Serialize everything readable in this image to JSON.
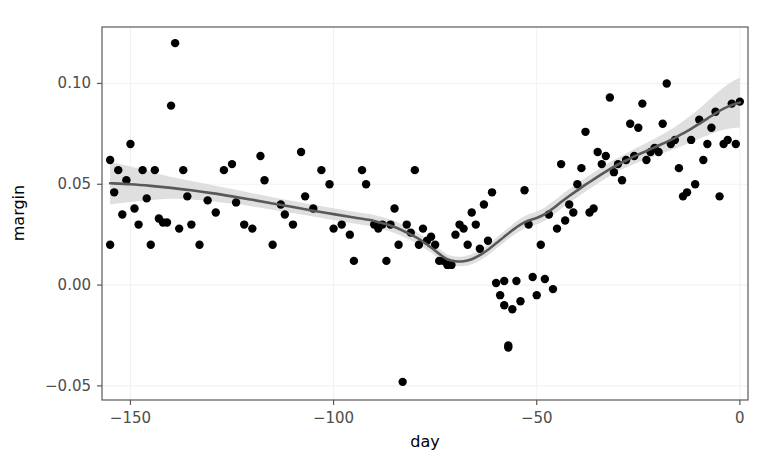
{
  "chart_data": {
    "type": "scatter",
    "title": "",
    "xlabel": "day",
    "ylabel": "margin",
    "xlim": [
      -157,
      2
    ],
    "ylim": [
      -0.057,
      0.128
    ],
    "xticks": [
      -150,
      -100,
      -50,
      0
    ],
    "xticklabels": [
      "−150",
      "−100",
      "−50",
      "0"
    ],
    "yticks": [
      -0.05,
      0.0,
      0.05,
      0.1
    ],
    "yticklabels": [
      "−0.05",
      "0.00",
      "0.05",
      "0.10"
    ],
    "grid": true,
    "legend": "none",
    "point_color": "#000000",
    "line_color": "#595959",
    "ribbon_color": "#d9d9d9",
    "panel_background": "#ffffff",
    "grid_color": "#f2f2f2",
    "panel_border_color": "#595959",
    "points": [
      [
        -155,
        0.062
      ],
      [
        -155,
        0.02
      ],
      [
        -154,
        0.046
      ],
      [
        -153,
        0.057
      ],
      [
        -152,
        0.035
      ],
      [
        -151,
        0.052
      ],
      [
        -150,
        0.07
      ],
      [
        -149,
        0.038
      ],
      [
        -148,
        0.03
      ],
      [
        -147,
        0.057
      ],
      [
        -146,
        0.043
      ],
      [
        -145,
        0.02
      ],
      [
        -144,
        0.057
      ],
      [
        -143,
        0.033
      ],
      [
        -142,
        0.031
      ],
      [
        -141,
        0.031
      ],
      [
        -140,
        0.089
      ],
      [
        -139,
        0.12
      ],
      [
        -138,
        0.028
      ],
      [
        -137,
        0.057
      ],
      [
        -136,
        0.044
      ],
      [
        -135,
        0.03
      ],
      [
        -133,
        0.02
      ],
      [
        -131,
        0.042
      ],
      [
        -129,
        0.036
      ],
      [
        -127,
        0.057
      ],
      [
        -125,
        0.06
      ],
      [
        -124,
        0.041
      ],
      [
        -122,
        0.03
      ],
      [
        -120,
        0.028
      ],
      [
        -118,
        0.064
      ],
      [
        -117,
        0.052
      ],
      [
        -115,
        0.02
      ],
      [
        -113,
        0.04
      ],
      [
        -112,
        0.035
      ],
      [
        -110,
        0.03
      ],
      [
        -108,
        0.066
      ],
      [
        -107,
        0.044
      ],
      [
        -105,
        0.038
      ],
      [
        -103,
        0.057
      ],
      [
        -101,
        0.05
      ],
      [
        -100,
        0.028
      ],
      [
        -98,
        0.03
      ],
      [
        -96,
        0.025
      ],
      [
        -95,
        0.012
      ],
      [
        -93,
        0.057
      ],
      [
        -92,
        0.05
      ],
      [
        -90,
        0.03
      ],
      [
        -89,
        0.028
      ],
      [
        -88,
        0.03
      ],
      [
        -87,
        0.012
      ],
      [
        -86,
        0.03
      ],
      [
        -85,
        0.038
      ],
      [
        -84,
        0.02
      ],
      [
        -83,
        -0.048
      ],
      [
        -82,
        0.03
      ],
      [
        -81,
        0.026
      ],
      [
        -80,
        0.057
      ],
      [
        -79,
        0.02
      ],
      [
        -78,
        0.028
      ],
      [
        -77,
        0.022
      ],
      [
        -76,
        0.024
      ],
      [
        -75,
        0.02
      ],
      [
        -74,
        0.012
      ],
      [
        -73,
        0.012
      ],
      [
        -72,
        0.01
      ],
      [
        -71,
        0.01
      ],
      [
        -70,
        0.025
      ],
      [
        -69,
        0.03
      ],
      [
        -68,
        0.028
      ],
      [
        -67,
        0.02
      ],
      [
        -66,
        0.036
      ],
      [
        -65,
        0.03
      ],
      [
        -64,
        0.018
      ],
      [
        -63,
        0.04
      ],
      [
        -62,
        0.022
      ],
      [
        -61,
        0.046
      ],
      [
        -60,
        0.001
      ],
      [
        -59,
        -0.005
      ],
      [
        -58,
        0.002
      ],
      [
        -58,
        -0.01
      ],
      [
        -57,
        -0.03
      ],
      [
        -57,
        -0.031
      ],
      [
        -56,
        -0.012
      ],
      [
        -55,
        0.002
      ],
      [
        -54,
        -0.008
      ],
      [
        -53,
        0.047
      ],
      [
        -52,
        0.03
      ],
      [
        -51,
        0.004
      ],
      [
        -50,
        -0.005
      ],
      [
        -49,
        0.02
      ],
      [
        -48,
        0.003
      ],
      [
        -47,
        0.035
      ],
      [
        -46,
        -0.002
      ],
      [
        -45,
        0.028
      ],
      [
        -44,
        0.06
      ],
      [
        -43,
        0.032
      ],
      [
        -42,
        0.04
      ],
      [
        -41,
        0.036
      ],
      [
        -40,
        0.05
      ],
      [
        -39,
        0.058
      ],
      [
        -38,
        0.076
      ],
      [
        -37,
        0.036
      ],
      [
        -36,
        0.038
      ],
      [
        -35,
        0.066
      ],
      [
        -34,
        0.06
      ],
      [
        -33,
        0.064
      ],
      [
        -32,
        0.093
      ],
      [
        -31,
        0.056
      ],
      [
        -30,
        0.06
      ],
      [
        -29,
        0.052
      ],
      [
        -28,
        0.062
      ],
      [
        -27,
        0.08
      ],
      [
        -26,
        0.064
      ],
      [
        -25,
        0.078
      ],
      [
        -24,
        0.09
      ],
      [
        -23,
        0.062
      ],
      [
        -22,
        0.066
      ],
      [
        -21,
        0.068
      ],
      [
        -20,
        0.066
      ],
      [
        -19,
        0.08
      ],
      [
        -18,
        0.1
      ],
      [
        -17,
        0.07
      ],
      [
        -16,
        0.072
      ],
      [
        -15,
        0.058
      ],
      [
        -14,
        0.044
      ],
      [
        -13,
        0.046
      ],
      [
        -12,
        0.072
      ],
      [
        -11,
        0.05
      ],
      [
        -10,
        0.082
      ],
      [
        -9,
        0.062
      ],
      [
        -8,
        0.07
      ],
      [
        -7,
        0.078
      ],
      [
        -6,
        0.086
      ],
      [
        -5,
        0.044
      ],
      [
        -4,
        0.07
      ],
      [
        -3,
        0.072
      ],
      [
        -2,
        0.09
      ],
      [
        -1,
        0.07
      ],
      [
        0,
        0.091
      ]
    ],
    "smooth_line": [
      [
        -155,
        0.0505
      ],
      [
        -150,
        0.05
      ],
      [
        -145,
        0.0492
      ],
      [
        -140,
        0.0482
      ],
      [
        -135,
        0.047
      ],
      [
        -130,
        0.0456
      ],
      [
        -125,
        0.044
      ],
      [
        -120,
        0.0423
      ],
      [
        -115,
        0.0405
      ],
      [
        -110,
        0.0387
      ],
      [
        -105,
        0.0369
      ],
      [
        -100,
        0.0352
      ],
      [
        -95,
        0.0335
      ],
      [
        -90,
        0.0318
      ],
      [
        -85,
        0.0288
      ],
      [
        -80,
        0.024
      ],
      [
        -78,
        0.0215
      ],
      [
        -76,
        0.0186
      ],
      [
        -74,
        0.0155
      ],
      [
        -72,
        0.0128
      ],
      [
        -70,
        0.0118
      ],
      [
        -68,
        0.0118
      ],
      [
        -66,
        0.0128
      ],
      [
        -64,
        0.0148
      ],
      [
        -62,
        0.0175
      ],
      [
        -60,
        0.0207
      ],
      [
        -58,
        0.024
      ],
      [
        -56,
        0.0272
      ],
      [
        -54,
        0.03
      ],
      [
        -52,
        0.032
      ],
      [
        -50,
        0.0333
      ],
      [
        -48,
        0.0352
      ],
      [
        -46,
        0.038
      ],
      [
        -44,
        0.0412
      ],
      [
        -42,
        0.0442
      ],
      [
        -40,
        0.047
      ],
      [
        -38,
        0.0498
      ],
      [
        -36,
        0.0524
      ],
      [
        -34,
        0.055
      ],
      [
        -32,
        0.0575
      ],
      [
        -30,
        0.0598
      ],
      [
        -28,
        0.0618
      ],
      [
        -26,
        0.0638
      ],
      [
        -24,
        0.0656
      ],
      [
        -22,
        0.0674
      ],
      [
        -20,
        0.0692
      ],
      [
        -18,
        0.071
      ],
      [
        -16,
        0.073
      ],
      [
        -14,
        0.0752
      ],
      [
        -12,
        0.0775
      ],
      [
        -10,
        0.08
      ],
      [
        -8,
        0.0826
      ],
      [
        -6,
        0.0852
      ],
      [
        -4,
        0.0875
      ],
      [
        -2,
        0.0893
      ],
      [
        0,
        0.0905
      ]
    ],
    "ribbon_lower": [
      [
        -155,
        0.04
      ],
      [
        -150,
        0.0412
      ],
      [
        -145,
        0.0422
      ],
      [
        -140,
        0.0428
      ],
      [
        -135,
        0.0424
      ],
      [
        -130,
        0.0416
      ],
      [
        -125,
        0.0404
      ],
      [
        -120,
        0.039
      ],
      [
        -115,
        0.0374
      ],
      [
        -110,
        0.0357
      ],
      [
        -105,
        0.034
      ],
      [
        -100,
        0.0323
      ],
      [
        -95,
        0.0306
      ],
      [
        -90,
        0.0288
      ],
      [
        -85,
        0.0258
      ],
      [
        -80,
        0.0212
      ],
      [
        -78,
        0.0188
      ],
      [
        -76,
        0.016
      ],
      [
        -74,
        0.013
      ],
      [
        -72,
        0.0104
      ],
      [
        -70,
        0.0094
      ],
      [
        -68,
        0.0094
      ],
      [
        -66,
        0.0103
      ],
      [
        -64,
        0.0122
      ],
      [
        -62,
        0.0148
      ],
      [
        -60,
        0.018
      ],
      [
        -58,
        0.0212
      ],
      [
        -56,
        0.0243
      ],
      [
        -54,
        0.027
      ],
      [
        -52,
        0.0289
      ],
      [
        -50,
        0.0301
      ],
      [
        -48,
        0.0319
      ],
      [
        -46,
        0.0346
      ],
      [
        -44,
        0.0378
      ],
      [
        -42,
        0.0408
      ],
      [
        -40,
        0.0436
      ],
      [
        -38,
        0.0464
      ],
      [
        -36,
        0.049
      ],
      [
        -34,
        0.0516
      ],
      [
        -32,
        0.0541
      ],
      [
        -30,
        0.0564
      ],
      [
        -28,
        0.0583
      ],
      [
        -26,
        0.0601
      ],
      [
        -24,
        0.0617
      ],
      [
        -22,
        0.0632
      ],
      [
        -20,
        0.0647
      ],
      [
        -18,
        0.0661
      ],
      [
        -16,
        0.0676
      ],
      [
        -14,
        0.0692
      ],
      [
        -12,
        0.0708
      ],
      [
        -10,
        0.0726
      ],
      [
        -8,
        0.0742
      ],
      [
        -6,
        0.0758
      ],
      [
        -4,
        0.077
      ],
      [
        -2,
        0.0778
      ],
      [
        0,
        0.078
      ]
    ],
    "ribbon_upper": [
      [
        -155,
        0.061
      ],
      [
        -150,
        0.0588
      ],
      [
        -145,
        0.0562
      ],
      [
        -140,
        0.0536
      ],
      [
        -135,
        0.0516
      ],
      [
        -130,
        0.0496
      ],
      [
        -125,
        0.0476
      ],
      [
        -120,
        0.0456
      ],
      [
        -115,
        0.0436
      ],
      [
        -110,
        0.0417
      ],
      [
        -105,
        0.0398
      ],
      [
        -100,
        0.0381
      ],
      [
        -95,
        0.0364
      ],
      [
        -90,
        0.0348
      ],
      [
        -85,
        0.0318
      ],
      [
        -80,
        0.0268
      ],
      [
        -78,
        0.0242
      ],
      [
        -76,
        0.0212
      ],
      [
        -74,
        0.018
      ],
      [
        -72,
        0.0152
      ],
      [
        -70,
        0.0142
      ],
      [
        -68,
        0.0142
      ],
      [
        -66,
        0.0153
      ],
      [
        -64,
        0.0174
      ],
      [
        -62,
        0.0202
      ],
      [
        -60,
        0.0234
      ],
      [
        -58,
        0.0268
      ],
      [
        -56,
        0.0301
      ],
      [
        -54,
        0.033
      ],
      [
        -52,
        0.0351
      ],
      [
        -50,
        0.0365
      ],
      [
        -48,
        0.0385
      ],
      [
        -46,
        0.0414
      ],
      [
        -44,
        0.0446
      ],
      [
        -42,
        0.0476
      ],
      [
        -40,
        0.0504
      ],
      [
        -38,
        0.0532
      ],
      [
        -36,
        0.0558
      ],
      [
        -34,
        0.0584
      ],
      [
        -32,
        0.0609
      ],
      [
        -30,
        0.0632
      ],
      [
        -28,
        0.0653
      ],
      [
        -26,
        0.0675
      ],
      [
        -24,
        0.0695
      ],
      [
        -22,
        0.0716
      ],
      [
        -20,
        0.0737
      ],
      [
        -18,
        0.0759
      ],
      [
        -16,
        0.0784
      ],
      [
        -14,
        0.0812
      ],
      [
        -12,
        0.0842
      ],
      [
        -10,
        0.0874
      ],
      [
        -8,
        0.091
      ],
      [
        -6,
        0.0946
      ],
      [
        -4,
        0.098
      ],
      [
        -2,
        0.1008
      ],
      [
        0,
        0.103
      ]
    ]
  }
}
